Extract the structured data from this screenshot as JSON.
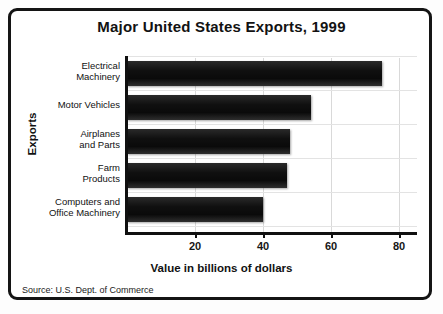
{
  "chart_data": {
    "type": "bar",
    "orientation": "horizontal",
    "title": "Major United States Exports, 1999",
    "xlabel": "Value in billions of dollars",
    "ylabel": "Exports",
    "categories": [
      "Electrical\nMachinery",
      "Motor Vehicles",
      "Airplanes\nand Parts",
      "Farm\nProducts",
      "Computers and\nOffice Machinery"
    ],
    "values": [
      75,
      54,
      48,
      47,
      40
    ],
    "xlim": [
      0,
      85
    ],
    "xticks": [
      20,
      40,
      60,
      80
    ],
    "xtick_labels": [
      "20",
      "40",
      "60",
      "80"
    ],
    "grid": true,
    "legend": false,
    "source": "Source: U.S. Dept. of Commerce",
    "bar_color": "#121212",
    "frame_color": "#141414"
  },
  "categories": [
    {
      "line1": "Electrical",
      "line2": "Machinery"
    },
    {
      "line1": "Motor Vehicles",
      "line2": ""
    },
    {
      "line1": "Airplanes",
      "line2": "and Parts"
    },
    {
      "line1": "Farm",
      "line2": "Products"
    },
    {
      "line1": "Computers and",
      "line2": "Office Machinery"
    }
  ],
  "xticks": [
    {
      "label": "20"
    },
    {
      "label": "40"
    },
    {
      "label": "60"
    },
    {
      "label": "80"
    }
  ]
}
